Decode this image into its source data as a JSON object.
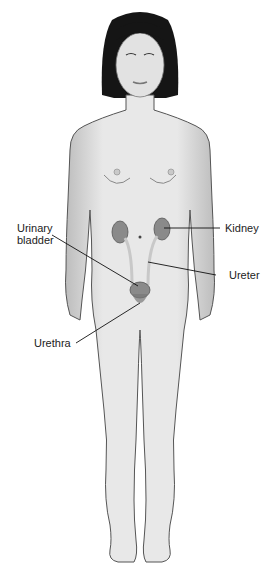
{
  "figure": {
    "colors": {
      "skin": "#e4e4e4",
      "skin_shade": "#bdbdbd",
      "outline": "#555555",
      "hair": "#151515",
      "organ": "#8a8a8a",
      "ureter": "#d6d6d6",
      "leader": "#111111",
      "text": "#222222"
    }
  },
  "labels": {
    "urinary_bladder_line1": "Urinary",
    "urinary_bladder_line2": "bladder",
    "kidney": "Kidney",
    "ureter": "Ureter",
    "urethra": "Urethra"
  }
}
